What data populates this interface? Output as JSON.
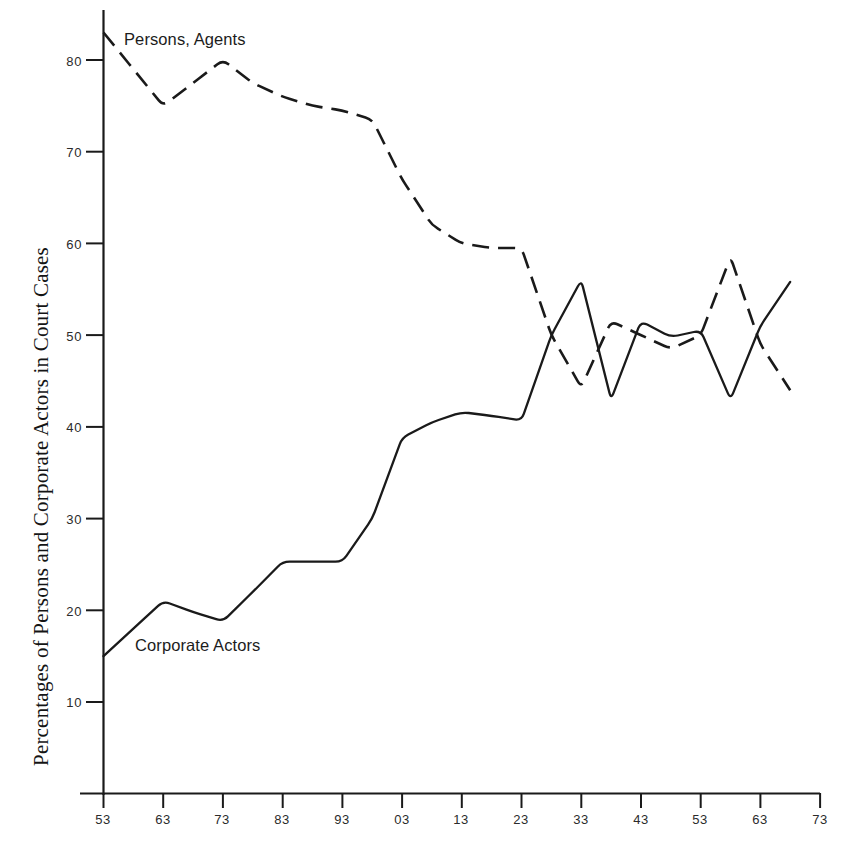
{
  "chart_data": {
    "type": "line",
    "title": "",
    "xlabel": "",
    "ylabel": "Percentages of Persons and Corporate Actors in Court Cases",
    "xlim": [
      1853,
      1973
    ],
    "ylim": [
      5,
      85
    ],
    "grid": false,
    "legend_position": "inline-labels",
    "x_tick_labels": [
      "53",
      "63",
      "73",
      "83",
      "93",
      "03",
      "13",
      "23",
      "33",
      "43",
      "53",
      "63",
      "73"
    ],
    "x_tick_values": [
      1853,
      1863,
      1873,
      1883,
      1893,
      1903,
      1913,
      1923,
      1933,
      1943,
      1953,
      1963,
      1973
    ],
    "y_tick_labels": [
      "10",
      "20",
      "30",
      "40",
      "50",
      "60",
      "70",
      "80"
    ],
    "y_tick_values": [
      10,
      20,
      30,
      40,
      50,
      60,
      70,
      80
    ],
    "x": [
      1853,
      1858,
      1863,
      1868,
      1873,
      1878,
      1883,
      1888,
      1893,
      1898,
      1903,
      1908,
      1913,
      1918,
      1923,
      1928,
      1933,
      1938,
      1943,
      1948,
      1953,
      1958,
      1963,
      1968
    ],
    "series": [
      {
        "name": "Persons, Agents",
        "style": "dashed",
        "color": "#1a1a1a",
        "values": [
          83.0,
          79.0,
          75.0,
          77.5,
          80.0,
          77.5,
          76.0,
          75.0,
          74.5,
          73.5,
          67.0,
          62.0,
          60.0,
          59.5,
          59.5,
          50.0,
          44.3,
          51.5,
          50.0,
          48.5,
          50.0,
          58.5,
          49.0,
          44.0
        ]
      },
      {
        "name": "Corporate Actors",
        "style": "solid",
        "color": "#1a1a1a",
        "values": [
          15.0,
          18.0,
          21.0,
          19.8,
          18.8,
          22.0,
          25.3,
          25.3,
          25.3,
          30.0,
          38.8,
          40.5,
          41.6,
          41.2,
          40.7,
          50.0,
          56.0,
          43.0,
          51.5,
          49.8,
          50.5,
          43.0,
          51.0,
          55.8
        ]
      }
    ],
    "annotations": [
      {
        "text": "Persons, Agents",
        "x": 1855.5,
        "y": 82.5
      },
      {
        "text": "Corporate Actors",
        "x": 1858.5,
        "y": 16.5
      }
    ]
  },
  "axis": {
    "y_title": "Percentages of Persons and Corporate Actors in Court Cases"
  }
}
